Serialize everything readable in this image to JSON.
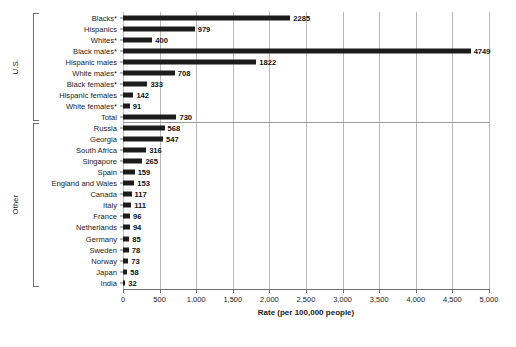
{
  "chart_data": {
    "type": "bar",
    "orientation": "horizontal",
    "title": "",
    "xlabel": "Rate (per 100,000 people)",
    "ylabel": "",
    "xlim": [
      0,
      5000
    ],
    "grid": true,
    "legend": false,
    "tick_labels": [
      "0",
      "500",
      "1,000",
      "1,500",
      "2,000",
      "2,500",
      "3,000",
      "3,500",
      "4,000",
      "4,500",
      "5,000"
    ],
    "tick_values": [
      0,
      500,
      1000,
      1500,
      2000,
      2500,
      3000,
      3500,
      4000,
      4500,
      5000
    ],
    "bar_color": "#1c1c1c",
    "groups": [
      {
        "name": "U.S.",
        "categories": [
          "Blacks*",
          "Hispanics",
          "Whites*",
          "Black males*",
          "Hispanic males",
          "White males*",
          "Black females*",
          "Hispanic females",
          "White females*",
          "Total"
        ],
        "values": [
          2285,
          979,
          400,
          4749,
          1822,
          708,
          333,
          142,
          91,
          730
        ]
      },
      {
        "name": "Other",
        "categories": [
          "Russia",
          "Georgia",
          "South Africa",
          "Singapore",
          "Spain",
          "England and Wales",
          "Canada",
          "Italy",
          "France",
          "Netherlands",
          "Germany",
          "Sweden",
          "Norway",
          "Japan",
          "India"
        ],
        "values": [
          568,
          547,
          316,
          265,
          159,
          153,
          117,
          111,
          96,
          94,
          85,
          78,
          73,
          58,
          32
        ]
      }
    ],
    "categories": [
      "Blacks*",
      "Hispanics",
      "Whites*",
      "Black males*",
      "Hispanic males",
      "White males*",
      "Black females*",
      "Hispanic females",
      "White females*",
      "Total",
      "Russia",
      "Georgia",
      "South Africa",
      "Singapore",
      "Spain",
      "England and Wales",
      "Canada",
      "Italy",
      "France",
      "Netherlands",
      "Germany",
      "Sweden",
      "Norway",
      "Japan",
      "India"
    ],
    "values": [
      2285,
      979,
      400,
      4749,
      1822,
      708,
      333,
      142,
      91,
      730,
      568,
      547,
      316,
      265,
      159,
      153,
      117,
      111,
      96,
      94,
      85,
      78,
      73,
      58,
      32
    ]
  },
  "caption": ""
}
